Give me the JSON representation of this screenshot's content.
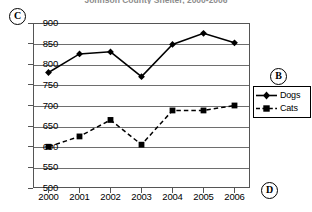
{
  "chart_data": {
    "type": "line",
    "title": "Johnson County Shelter, 2000-2006",
    "xlabel": "",
    "ylabel": "",
    "categories": [
      "2000",
      "2001",
      "2002",
      "2003",
      "2004",
      "2005",
      "2006"
    ],
    "x": [
      2000,
      2001,
      2002,
      2003,
      2004,
      2005,
      2006
    ],
    "series": [
      {
        "name": "Dogs",
        "values": [
          780,
          825,
          830,
          770,
          848,
          875,
          852
        ],
        "marker": "diamond",
        "linestyle": "solid",
        "color": "#000000"
      },
      {
        "name": "Cats",
        "values": [
          600,
          625,
          665,
          605,
          688,
          688,
          700
        ],
        "marker": "square",
        "linestyle": "dashed",
        "color": "#000000"
      }
    ],
    "ylim": [
      500,
      900
    ],
    "yticks": [
      500,
      550,
      600,
      650,
      700,
      750,
      800,
      850,
      900
    ],
    "ytick_labels": [
      "500",
      "550",
      "600",
      "650",
      "700",
      "750",
      "800",
      "850",
      "900"
    ],
    "grid": true,
    "grid_axis": "y",
    "legend_position": "right"
  },
  "annotations": {
    "legend_marker": "B",
    "yaxis_marker": "C",
    "xaxis_marker": "D"
  },
  "legend": {
    "items": [
      {
        "label": "Dogs"
      },
      {
        "label": "Cats"
      }
    ]
  },
  "colors": {
    "axis": "#555555",
    "grid": "#6e6e6e",
    "series": "#000000",
    "title": "#8d8d8d"
  }
}
